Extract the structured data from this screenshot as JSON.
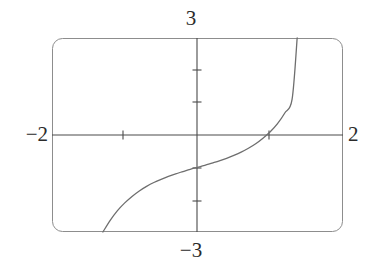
{
  "figure": {
    "kind": "graphing-calculator-screen",
    "frame": {
      "left_px": 52,
      "top_px": 38,
      "right_px": 343,
      "bottom_px": 232,
      "corner_radius_px": 10,
      "border_color": "#8a8a8a",
      "fill_color": "#ffffff"
    },
    "axis_color": "#4a4a4a",
    "curve_color": "#6e6e6e",
    "text_color": "#2b2b2b"
  },
  "labels": {
    "y_max": "3",
    "y_min": "−3",
    "x_min": "−2",
    "x_max": "2"
  },
  "chart_data": {
    "type": "line",
    "title": "",
    "xlabel": "",
    "ylabel": "",
    "xlim": [
      -2,
      2
    ],
    "ylim": [
      -3,
      3
    ],
    "grid": false,
    "legend": "none",
    "xticks": [
      -1,
      1
    ],
    "yticks": [
      -2,
      -1,
      1,
      2
    ],
    "xtick_labels": [
      "",
      ""
    ],
    "ytick_labels": [
      "",
      "",
      "",
      ""
    ],
    "axis_end_labels": {
      "left": "−2",
      "right": "2",
      "top": "3",
      "bottom": "−3"
    },
    "series": [
      {
        "name": "curve",
        "shape": "increasing-cubic",
        "x": [
          -1.3,
          -1.2,
          -1.1,
          -1.0,
          -0.9,
          -0.8,
          -0.7,
          -0.6,
          -0.5,
          -0.4,
          -0.3,
          -0.2,
          -0.1,
          0.0,
          0.1,
          0.2,
          0.3,
          0.4,
          0.5,
          0.6,
          0.7,
          0.8,
          0.9,
          1.0,
          1.1,
          1.2,
          1.3,
          1.37
        ],
        "y": [
          -3.0,
          -2.64,
          -2.34,
          -2.1,
          -1.9,
          -1.73,
          -1.59,
          -1.47,
          -1.37,
          -1.28,
          -1.2,
          -1.13,
          -1.06,
          -1.0,
          -0.94,
          -0.87,
          -0.8,
          -0.72,
          -0.63,
          -0.53,
          -0.41,
          -0.27,
          -0.1,
          0.1,
          0.35,
          0.68,
          1.1,
          3.0
        ]
      }
    ],
    "notes": {
      "y_intercept": -1,
      "x_intercept_approx": 0.95,
      "enters_bottom_at_x": -1.3,
      "exits_top_at_x": 1.37
    }
  }
}
